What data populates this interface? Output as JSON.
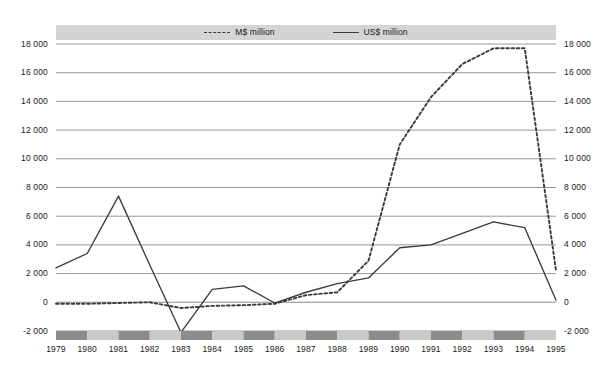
{
  "chart_data": {
    "type": "line",
    "title": "",
    "subtitle": "",
    "xlabel": "",
    "ylabel": "",
    "categories": [
      "1979",
      "1980",
      "1981",
      "1982",
      "1983",
      "1984",
      "1985",
      "1986",
      "1987",
      "1988",
      "1989",
      "1990",
      "1991",
      "1992",
      "1993",
      "1994",
      "1995"
    ],
    "x": [
      1979,
      1980,
      1981,
      1982,
      1983,
      1984,
      1985,
      1986,
      1987,
      1988,
      1989,
      1990,
      1991,
      1992,
      1993,
      1994,
      1995
    ],
    "series": [
      {
        "name": "M$ million",
        "style": "dashed",
        "color": "#3a3a3a",
        "values": [
          -100,
          -100,
          -50,
          0,
          -400,
          -250,
          -200,
          -100,
          500,
          700,
          2900,
          11000,
          14300,
          16600,
          17700,
          17700,
          2200
        ]
      },
      {
        "name": "US$ million",
        "style": "solid",
        "color": "#3a3a3a",
        "values": [
          2400,
          3400,
          7400,
          2600,
          -2100,
          900,
          1150,
          -50,
          700,
          1300,
          1700,
          3800,
          4000,
          4800,
          5600,
          5200,
          150
        ]
      }
    ],
    "ylim": [
      -2000,
      18000
    ],
    "yticks": [
      -2000,
      0,
      2000,
      4000,
      6000,
      8000,
      10000,
      12000,
      14000,
      16000,
      18000
    ],
    "ytick_labels_left": [
      "-2 000",
      "0",
      "2 000",
      "4 000",
      "6 000",
      "8 000",
      "10 000",
      "12 000",
      "14 000",
      "16 000",
      "18 000"
    ],
    "ytick_labels_right": [
      "-2 000",
      "0",
      "2 000",
      "4 000",
      "6 000",
      "8 000",
      "10 000",
      "12 000",
      "14 000",
      "16 000",
      "18 000"
    ],
    "grid": true,
    "grid_color": "#8c8c8c",
    "legend_position": "top",
    "legend_band_color": "#d4d4d4",
    "axis_band_dark": "#8c8c8c",
    "axis_band_light": "#c9c9c9",
    "background": "#ffffff"
  },
  "legend": {
    "entries": [
      {
        "label": "M$ million",
        "swatch": "dashed-line-swatch"
      },
      {
        "label": "US$ million",
        "swatch": "solid-line-swatch"
      }
    ]
  }
}
